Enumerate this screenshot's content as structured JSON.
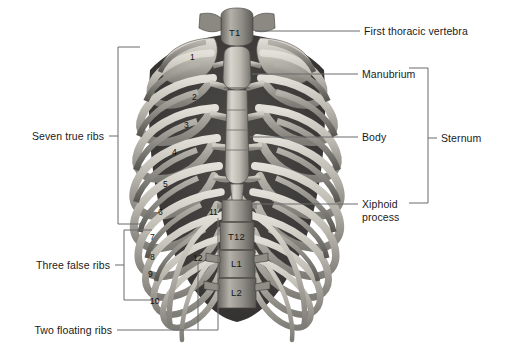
{
  "figure": {
    "background_color": "#ffffff",
    "leader_line_color": "#6b6b6b",
    "bracket_color": "#6b6b6b",
    "bone_light": "#d9d6cf",
    "bone_mid": "#a9a69e",
    "bone_dark": "#6f6d68",
    "bone_shadow": "#4a4946"
  },
  "callouts": {
    "right": [
      {
        "id": "first-thoracic-vertebra",
        "label": "First thoracic vertebra"
      },
      {
        "id": "manubrium",
        "label": "Manubrium"
      },
      {
        "id": "body",
        "label": "Body"
      },
      {
        "id": "xiphoid-process",
        "label": "Xiphoid\nprocess"
      },
      {
        "id": "sternum",
        "label": "Sternum"
      }
    ],
    "left": [
      {
        "id": "seven-true-ribs",
        "label": "Seven true ribs"
      },
      {
        "id": "three-false-ribs",
        "label": "Three false ribs"
      },
      {
        "id": "two-floating-ribs",
        "label": "Two floating ribs"
      }
    ]
  },
  "rib_numbers": [
    {
      "id": "rib-1",
      "label": "1"
    },
    {
      "id": "rib-2",
      "label": "2"
    },
    {
      "id": "rib-3",
      "label": "3"
    },
    {
      "id": "rib-4",
      "label": "4"
    },
    {
      "id": "rib-5",
      "label": "5"
    },
    {
      "id": "rib-6",
      "label": "6"
    },
    {
      "id": "rib-7",
      "label": "7"
    },
    {
      "id": "rib-8",
      "label": "8"
    },
    {
      "id": "rib-9",
      "label": "9"
    },
    {
      "id": "rib-10",
      "label": "10"
    },
    {
      "id": "rib-11",
      "label": "11"
    },
    {
      "id": "rib-12",
      "label": "12"
    }
  ],
  "vertebra_labels": [
    {
      "id": "vertebra-t1",
      "label": "T1"
    },
    {
      "id": "vertebra-t12",
      "label": "T12"
    },
    {
      "id": "vertebra-l1",
      "label": "L1"
    },
    {
      "id": "vertebra-l2",
      "label": "L2"
    }
  ]
}
